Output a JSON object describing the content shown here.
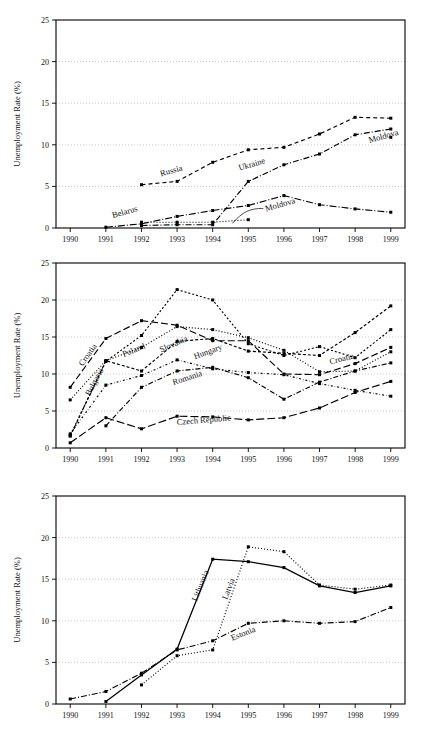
{
  "figure": {
    "ylabel": "Unemployment Rate (%)",
    "y_ticks": [
      "0",
      "5",
      "10",
      "15",
      "20",
      "25"
    ],
    "x_ticks": [
      "1990",
      "1991",
      "1992",
      "1993",
      "1994",
      "1995",
      "1996",
      "1997",
      "1998",
      "1999"
    ]
  },
  "chart_data": [
    {
      "type": "line",
      "title": "",
      "xlabel": "",
      "ylabel": "Unemployment Rate (%)",
      "x": [
        1990,
        1991,
        1992,
        1993,
        1994,
        1995,
        1996,
        1997,
        1998,
        1999
      ],
      "xlim": [
        1989.6,
        1999.4
      ],
      "ylim": [
        0,
        25
      ],
      "yticks": [
        0,
        5,
        10,
        15,
        20,
        25
      ],
      "grid": true,
      "legend": "inline-annotations",
      "series": [
        {
          "name": "Russia",
          "label": "Russia",
          "dash": "4 3",
          "values": [
            null,
            null,
            5.2,
            5.6,
            7.9,
            9.4,
            9.7,
            11.3,
            13.3,
            13.2
          ]
        },
        {
          "name": "Ukraine",
          "label": "Ukraine",
          "dash": "6 2 1 2",
          "values": [
            null,
            null,
            0.3,
            0.4,
            0.4,
            5.6,
            7.6,
            8.9,
            11.2,
            11.9
          ]
        },
        {
          "name": "Belarus",
          "label": "Belarus",
          "dash": "7 2 1 2",
          "values": [
            null,
            0.1,
            0.5,
            1.4,
            2.1,
            2.7,
            3.9,
            2.8,
            2.3,
            1.9
          ]
        },
        {
          "name": "Moldova",
          "label": "Moldova",
          "dash": "1 2",
          "values": [
            null,
            null,
            0.7,
            0.7,
            0.7,
            1.0,
            null,
            null,
            null,
            null
          ]
        },
        {
          "name": "Moldova-right",
          "label": "Moldova",
          "dash": "2 2",
          "values": [
            null,
            null,
            null,
            null,
            null,
            null,
            null,
            null,
            null,
            10.9
          ]
        }
      ],
      "annotations": [
        {
          "text": "Russia",
          "x": 1992.55,
          "y": 6.2
        },
        {
          "text": "Ukraine",
          "x": 1994.75,
          "y": 6.9
        },
        {
          "text": "Belarus",
          "x": 1991.2,
          "y": 1.2
        },
        {
          "text": "Moldova",
          "x": 1995.5,
          "y": 2.0
        },
        {
          "text": "Moldova",
          "x": 1998.4,
          "y": 10.2
        }
      ]
    },
    {
      "type": "line",
      "title": "",
      "xlabel": "",
      "ylabel": "Unemployment Rate (%)",
      "x": [
        1990,
        1991,
        1992,
        1993,
        1994,
        1995,
        1996,
        1997,
        1998,
        1999
      ],
      "xlim": [
        1989.6,
        1999.4
      ],
      "ylim": [
        0,
        25
      ],
      "yticks": [
        0,
        5,
        10,
        15,
        20,
        25
      ],
      "grid": true,
      "legend": "inline-annotations",
      "series": [
        {
          "name": "Poland",
          "label": "Poland",
          "dash": "1 2",
          "values": [
            6.5,
            11.8,
            13.6,
            16.4,
            16.0,
            14.9,
            13.2,
            10.3,
            10.4,
            13.0
          ]
        },
        {
          "name": "Croatia",
          "label": "Croatia",
          "dash": "7 3",
          "values": [
            8.2,
            14.8,
            17.2,
            16.6,
            14.5,
            14.5,
            10.0,
            9.9,
            11.4,
            13.6
          ]
        },
        {
          "name": "Bulgaria",
          "label": "Bulgaria",
          "dash": "2 2",
          "values": [
            1.7,
            11.7,
            15.2,
            21.4,
            20.0,
            14.1,
            12.5,
            13.7,
            12.2,
            16.0
          ]
        },
        {
          "name": "Slovakia",
          "label": "Slovakia",
          "dash": "3 2",
          "values": [
            1.6,
            11.8,
            10.4,
            14.4,
            14.8,
            13.1,
            12.8,
            12.5,
            15.6,
            19.2
          ]
        },
        {
          "name": "Hungary",
          "label": "Hungary",
          "dash": "2 2 0.5 2",
          "values": [
            1.9,
            8.5,
            9.8,
            11.9,
            10.7,
            10.2,
            9.9,
            8.7,
            7.8,
            7.0
          ]
        },
        {
          "name": "Romania",
          "label": "Romania",
          "dash": "5 2 1 2",
          "values": [
            null,
            3.0,
            8.2,
            10.4,
            10.9,
            9.5,
            6.6,
            8.9,
            10.4,
            11.5
          ]
        },
        {
          "name": "Czech Republic",
          "label": "Czech Republic",
          "dash": "8 3",
          "values": [
            0.7,
            4.1,
            2.6,
            4.3,
            4.2,
            3.8,
            4.1,
            5.4,
            7.5,
            9.0
          ]
        }
      ],
      "annotations": [
        {
          "text": "Croatia",
          "x": 1990.35,
          "y": 11.0,
          "rotate": -55
        },
        {
          "text": "Bulgaria",
          "x": 1990.55,
          "y": 7.0,
          "rotate": -62
        },
        {
          "text": "Poland",
          "x": 1991.5,
          "y": 12.3,
          "rotate": -22
        },
        {
          "text": "Slovakia",
          "x": 1992.55,
          "y": 12.9,
          "rotate": -24
        },
        {
          "text": "Hungary",
          "x": 1993.5,
          "y": 12.0,
          "rotate": -20
        },
        {
          "text": "Romania",
          "x": 1992.9,
          "y": 8.5,
          "rotate": -18
        },
        {
          "text": "Czech  Republic",
          "x": 1993.0,
          "y": 3.1,
          "rotate": -5
        },
        {
          "text": "Croatia",
          "x": 1997.3,
          "y": 11.3,
          "rotate": -14
        }
      ]
    },
    {
      "type": "line",
      "title": "",
      "xlabel": "",
      "ylabel": "Unemployment Rate (%)",
      "x": [
        1990,
        1991,
        1992,
        1993,
        1994,
        1995,
        1996,
        1997,
        1998,
        1999
      ],
      "xlim": [
        1989.6,
        1999.4
      ],
      "ylim": [
        0,
        25
      ],
      "yticks": [
        0,
        5,
        10,
        15,
        20,
        25
      ],
      "grid": true,
      "legend": "inline-annotations",
      "series": [
        {
          "name": "Lithuania",
          "label": "Lithuania",
          "dash": "0",
          "values": [
            null,
            0.3,
            3.5,
            6.6,
            17.4,
            17.1,
            16.4,
            14.2,
            13.4,
            14.2
          ]
        },
        {
          "name": "Latvia",
          "label": "Latvia",
          "dash": "1 2",
          "values": [
            null,
            null,
            2.3,
            5.8,
            6.5,
            18.9,
            18.3,
            14.3,
            13.8,
            14.3
          ]
        },
        {
          "name": "Estonia",
          "label": "Estonia",
          "dash": "6 2 1 2",
          "values": [
            0.6,
            1.5,
            3.7,
            6.5,
            7.6,
            9.7,
            10.0,
            9.7,
            9.9,
            11.6
          ]
        }
      ],
      "annotations": [
        {
          "text": "Lithuania",
          "x": 1993.55,
          "y": 12.3,
          "rotate": -68
        },
        {
          "text": "Latvia",
          "x": 1994.4,
          "y": 12.5,
          "rotate": -68
        },
        {
          "text": "Estonia",
          "x": 1994.55,
          "y": 7.6,
          "rotate": -22
        }
      ]
    }
  ]
}
